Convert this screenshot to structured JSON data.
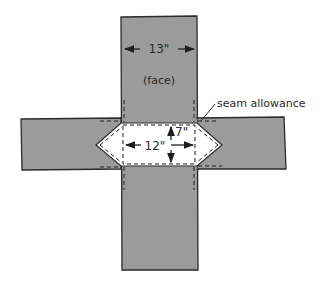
{
  "diagram": {
    "labels": {
      "width_top": "13\"",
      "face": "(face)",
      "seam_allowance": "seam allowance",
      "width_center": "12\"",
      "height_center": "7\""
    },
    "colors": {
      "fabric": "#9b9b9b",
      "outline": "#2b2b2b",
      "cutout": "#ffffff",
      "background": "#ffffff"
    }
  }
}
